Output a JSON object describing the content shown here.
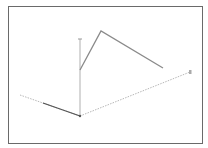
{
  "diagram": {
    "type": "3d-axes-with-polyline",
    "colors": {
      "frame": "#6a6a6a",
      "axis_dotted": "#b8b8b8",
      "axis_solid": "#bdbdbd",
      "axis_dark": "#555555",
      "polyline": "#8a8a8a"
    },
    "origin": [
      80,
      116
    ],
    "axes": {
      "vertical": {
        "from": [
          80,
          116
        ],
        "to": [
          80,
          39
        ],
        "style": "solid"
      },
      "right": {
        "from": [
          80,
          116
        ],
        "to": [
          190,
          72
        ],
        "style": "dotted"
      },
      "left": {
        "from": [
          80,
          116
        ],
        "to": [
          20,
          95
        ],
        "style": "dotted"
      },
      "left_dark_segment": {
        "from": [
          80,
          116
        ],
        "to": [
          43,
          103
        ]
      }
    },
    "polyline": [
      [
        80,
        70
      ],
      [
        101,
        31
      ],
      [
        163,
        68
      ]
    ]
  }
}
